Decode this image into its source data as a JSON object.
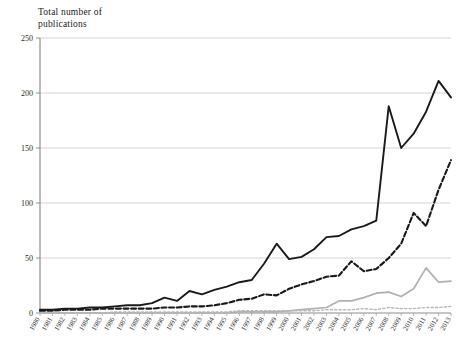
{
  "chart_data": {
    "type": "line",
    "title": "Total number of\npublications",
    "xlabel": "",
    "ylabel": "Total number of publications",
    "ylim": [
      0,
      250
    ],
    "yticks": [
      0,
      50,
      100,
      150,
      200,
      250
    ],
    "grid": true,
    "legend": "none",
    "categories": [
      "1980",
      "1981",
      "1982",
      "1983",
      "1984",
      "1985",
      "1986",
      "1987",
      "1988",
      "1989",
      "1990",
      "1991",
      "1992",
      "1993",
      "1994",
      "1995",
      "1996",
      "1997",
      "1998",
      "1999",
      "2000",
      "2001",
      "2002",
      "2003",
      "2004",
      "2005",
      "2006",
      "2007",
      "2008",
      "2009",
      "2010",
      "2011",
      "2012",
      "2013"
    ],
    "series": [
      {
        "name": "series-solid-black",
        "style": "solid",
        "color": "#1a1a1a",
        "width": 1.9,
        "values": [
          3,
          3,
          4,
          4,
          5,
          5,
          6,
          7,
          7,
          9,
          14,
          11,
          20,
          17,
          21,
          24,
          28,
          30,
          45,
          63,
          49,
          51,
          58,
          69,
          70,
          76,
          79,
          84,
          188,
          150,
          163,
          183,
          211,
          196
        ]
      },
      {
        "name": "series-dashed-black",
        "style": "dashed",
        "color": "#1a1a1a",
        "width": 2.1,
        "values": [
          2,
          2,
          3,
          3,
          3,
          4,
          4,
          4,
          4,
          4,
          5,
          5,
          6,
          6,
          7,
          9,
          12,
          13,
          17,
          16,
          22,
          26,
          29,
          33,
          34,
          47,
          38,
          40,
          50,
          63,
          91,
          79,
          112,
          139
        ]
      },
      {
        "name": "series-solid-gray",
        "style": "solid",
        "color": "#b0b0b0",
        "width": 1.7,
        "values": [
          0,
          0,
          0,
          0,
          0,
          0,
          0,
          0,
          0,
          0,
          0,
          0,
          0,
          0,
          0,
          0,
          1,
          1,
          1,
          1,
          2,
          3,
          4,
          5,
          11,
          11,
          14,
          18,
          19,
          15,
          22,
          41,
          28,
          29
        ]
      },
      {
        "name": "series-dotted-gray",
        "style": "dotted",
        "color": "#b8b8b8",
        "width": 1.4,
        "values": [
          0,
          0,
          0,
          0,
          0,
          0,
          1,
          1,
          1,
          1,
          1,
          1,
          1,
          1,
          1,
          1,
          2,
          2,
          2,
          2,
          2,
          2,
          2,
          3,
          3,
          3,
          4,
          3,
          5,
          4,
          4,
          5,
          5,
          6
        ]
      }
    ]
  }
}
